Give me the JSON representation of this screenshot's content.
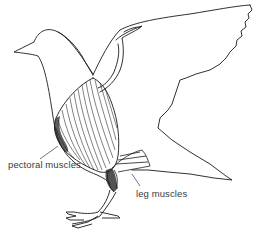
{
  "diagram": {
    "labels": {
      "pectoral": "pectoral muscles",
      "leg": "leg muscles"
    },
    "colors": {
      "line": "#1a1a1a",
      "text": "#3a3a3a",
      "background": "#ffffff"
    }
  }
}
